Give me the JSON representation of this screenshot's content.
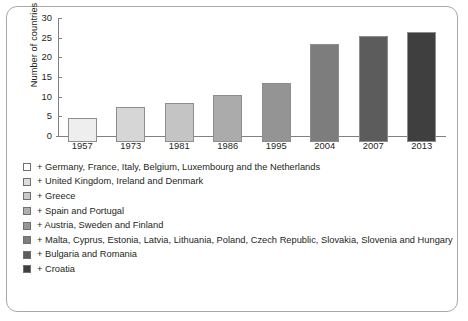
{
  "chart_data": {
    "type": "bar",
    "title": "",
    "xlabel": "",
    "ylabel": "Number of countries",
    "categories": [
      "1957",
      "1973",
      "1981",
      "1986",
      "1995",
      "2004",
      "2007",
      "2013"
    ],
    "values": [
      6,
      9,
      10,
      12,
      15,
      25,
      27,
      28
    ],
    "ylim": [
      0,
      30
    ],
    "yticks": [
      "0",
      "5",
      "10",
      "15",
      "20",
      "25",
      "30"
    ],
    "ytick_values": [
      0,
      5,
      10,
      15,
      20,
      25,
      30
    ],
    "grid": false,
    "legend_position": "below",
    "bar_colors": [
      "#eeeeee",
      "#d6d6d6",
      "#c4c4c4",
      "#ababab",
      "#949494",
      "#7d7d7d",
      "#5c5c5c",
      "#3f3f3f"
    ],
    "series": [
      {
        "name": "Number of countries",
        "values": [
          6,
          9,
          10,
          12,
          15,
          25,
          27,
          28
        ]
      }
    ],
    "legend": [
      {
        "swatch": "#ffffff",
        "label": "+ Germany, France, Italy, Belgium, Luxembourg and the Netherlands"
      },
      {
        "swatch": "#dcdcdc",
        "label": "+ United Kingdom, Ireland and Denmark"
      },
      {
        "swatch": "#c9c9c9",
        "label": "+ Greece"
      },
      {
        "swatch": "#aeaeae",
        "label": "+ Spain and Portugal"
      },
      {
        "swatch": "#969696",
        "label": "+ Austria, Sweden and Finland"
      },
      {
        "swatch": "#7d7d7d",
        "label": "+ Malta, Cyprus, Estonia, Latvia, Lithuania, Poland, Czech Republic, Slovakia, Slovenia and Hungary"
      },
      {
        "swatch": "#5c5c5c",
        "label": "+ Bulgaria and Romania"
      },
      {
        "swatch": "#3f3f3f",
        "label": "+ Croatia"
      }
    ]
  }
}
